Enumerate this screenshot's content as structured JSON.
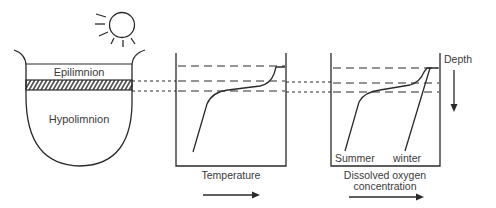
{
  "diagram": {
    "type": "lake-stratification",
    "lake": {
      "upper_layer_label": "Epilimnion",
      "lower_layer_label": "Hypolimnion",
      "thermocline_style": "hatched-band"
    },
    "temperature_panel": {
      "xlabel": "Temperature",
      "profile": "single-curve-thermocline"
    },
    "oxygen_panel": {
      "xlabel_line1": "Dissolved oxygen",
      "xlabel_line2": "concentration",
      "curve_labels": [
        "Summer",
        "winter"
      ]
    },
    "depth_label": "Depth",
    "icons": [
      "sun-icon",
      "right-arrow-icon",
      "down-arrow-icon"
    ],
    "colors": {
      "stroke": "#2a2a2a",
      "text": "#3a3a3a",
      "background": "#ffffff"
    }
  }
}
